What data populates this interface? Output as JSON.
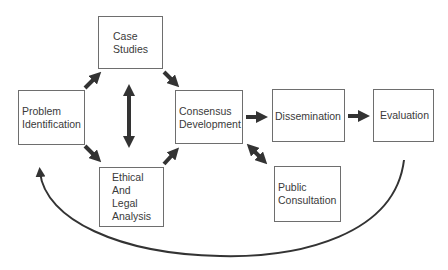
{
  "diagram": {
    "nodes": {
      "case_studies": {
        "lines": [
          "Case",
          "Studies"
        ]
      },
      "problem_identification": {
        "lines": [
          "Problem",
          "Identification"
        ]
      },
      "consensus_development": {
        "lines": [
          "Consensus",
          "Development"
        ]
      },
      "ethical_legal_analysis": {
        "lines": [
          "Ethical",
          "And",
          "Legal",
          "Analysis"
        ]
      },
      "dissemination": {
        "lines": [
          "Dissemination"
        ]
      },
      "evaluation": {
        "lines": [
          "Evaluation"
        ]
      },
      "public_consultation": {
        "lines": [
          "Public",
          "Consultation"
        ]
      }
    },
    "edges": [
      {
        "from": "Problem Identification",
        "to": "Case Studies",
        "type": "arrow"
      },
      {
        "from": "Problem Identification",
        "to": "Ethical And Legal Analysis",
        "type": "arrow"
      },
      {
        "from": "Case Studies",
        "to": "Ethical And Legal Analysis",
        "type": "bidirectional"
      },
      {
        "from": "Case Studies",
        "to": "Consensus Development",
        "type": "arrow"
      },
      {
        "from": "Ethical And Legal Analysis",
        "to": "Consensus Development",
        "type": "arrow"
      },
      {
        "from": "Consensus Development",
        "to": "Dissemination",
        "type": "arrow"
      },
      {
        "from": "Consensus Development",
        "to": "Public Consultation",
        "type": "bidirectional"
      },
      {
        "from": "Dissemination",
        "to": "Evaluation",
        "type": "arrow"
      },
      {
        "from": "Evaluation",
        "to": "Problem Identification",
        "type": "curved-feedback"
      }
    ],
    "colors": {
      "arrow": "#333333",
      "border": "#6e6e6e",
      "text": "#3a3a3a"
    }
  }
}
